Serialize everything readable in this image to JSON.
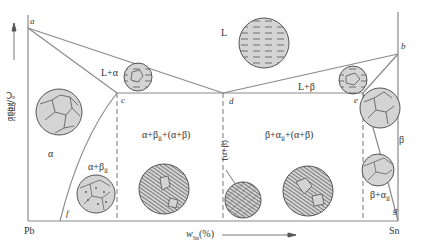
{
  "diagram": {
    "axes": {
      "y_label": "温度/℃",
      "x_label_main": "w",
      "x_label_sub": "Sn",
      "x_label_tail": "(%)",
      "x_left": "Pb",
      "x_right": "Sn"
    },
    "points": {
      "a": "a",
      "b": "b",
      "c": "c",
      "d": "d",
      "e": "e",
      "f": "f",
      "g": "g"
    },
    "regions": {
      "L": "L",
      "L_alpha": "L+α",
      "L_beta": "L+β",
      "alpha": "α",
      "beta": "β",
      "alpha_betaII": "α+β",
      "alpha_betaII_sub": "Ⅱ",
      "hypo": "α+β",
      "hypo_sub": "Ⅱ",
      "hypo_tail": "+(α+β)",
      "eutectic": "(α+β)",
      "hyper": "β+α",
      "hyper_sub": "Ⅱ",
      "hyper_tail": "+(α+β)",
      "beta_alphaII": "β+α",
      "beta_alphaII_sub": "Ⅱ"
    },
    "colors": {
      "line": "#8a8a8a",
      "circle_fill": "#d4d4d4",
      "circle_stroke": "#555555",
      "text": "#333333"
    }
  }
}
